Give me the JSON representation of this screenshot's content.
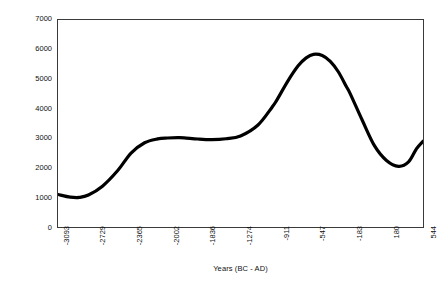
{
  "chart_data": {
    "type": "line",
    "title": "",
    "xlabel": "Years (BC - AD)",
    "ylabel": "Arboreal Pollen Count",
    "xlim": [
      -3093,
      544
    ],
    "ylim": [
      0,
      7000
    ],
    "grid": false,
    "legend": "none",
    "y_ticks": [
      7000,
      6000,
      5000,
      4000,
      3000,
      2000,
      1000,
      0
    ],
    "x_ticks": [
      "-3093",
      "-2729",
      "-2365",
      "-2002",
      "-1836",
      "-1274",
      "-911",
      "-547",
      "-183",
      "180",
      "544"
    ],
    "series": [
      {
        "name": "Arboreal Pollen Count",
        "color": "#000000",
        "x": [
          -3093,
          -2970,
          -2880,
          -2790,
          -2650,
          -2500,
          -2365,
          -2230,
          -2100,
          -2002,
          -1900,
          -1836,
          -1700,
          -1560,
          -1420,
          -1274,
          -1100,
          -960,
          -911,
          -800,
          -700,
          -620,
          -547,
          -460,
          -380,
          -300,
          -220,
          -183,
          -60,
          60,
          180,
          300,
          400,
          480,
          544
        ],
        "y": [
          1100,
          1010,
          1000,
          1080,
          1380,
          1900,
          2500,
          2850,
          2980,
          3010,
          3020,
          3015,
          2975,
          2955,
          2985,
          3080,
          3450,
          4050,
          4300,
          4950,
          5450,
          5720,
          5840,
          5800,
          5600,
          5250,
          4750,
          4520,
          3600,
          2750,
          2250,
          2050,
          2200,
          2650,
          2900
        ]
      }
    ]
  }
}
